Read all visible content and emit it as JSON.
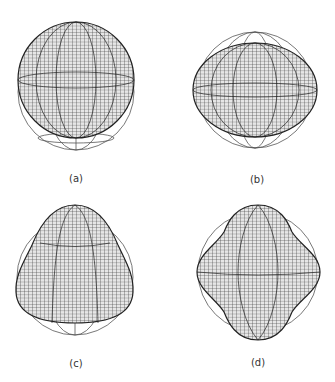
{
  "figure": {
    "panels": [
      {
        "id": "a",
        "label": "(a)",
        "shape": "sphere-shifted-up",
        "cx": 76,
        "cy": 92,
        "ref_r": 58
      },
      {
        "id": "b",
        "label": "(b)",
        "shape": "oblate-spheroid",
        "cx": 255,
        "cy": 90,
        "ref_r": 58
      },
      {
        "id": "c",
        "label": "(c)",
        "shape": "pear-shaped-octupole",
        "cx": 75,
        "cy": 277,
        "ref_r": 58
      },
      {
        "id": "d",
        "label": "(d)",
        "shape": "hexadecapole-diamond",
        "cx": 258,
        "cy": 272,
        "ref_r": 58
      }
    ],
    "colors": {
      "mesh": "#333333",
      "ref": "#555555",
      "bg": "#ffffff"
    }
  }
}
